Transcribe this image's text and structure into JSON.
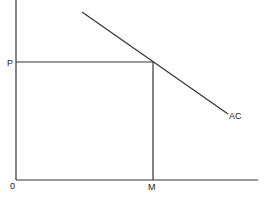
{
  "diagram": {
    "type": "economics-cost-curve",
    "labels": {
      "origin": "0",
      "price": "P",
      "quantity": "M",
      "curve": "AC"
    },
    "colors": {
      "line": "#333333",
      "text": "#222222",
      "background": "#ffffff"
    },
    "geometry": {
      "y_axis": {
        "x": 16,
        "y1": 0,
        "y2": 180
      },
      "x_axis": {
        "y": 180,
        "x1": 16,
        "x2": 258
      },
      "price_line": {
        "y": 62,
        "x1": 16,
        "x2": 153
      },
      "quantity_line": {
        "x": 153,
        "y1": 62,
        "y2": 180
      },
      "ac_curve": {
        "x1": 82,
        "y1": 12,
        "x2": 228,
        "y2": 114
      }
    }
  }
}
